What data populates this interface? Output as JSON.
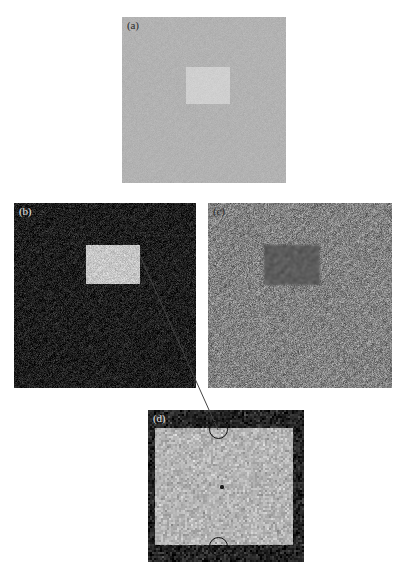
{
  "figure": {
    "width": 406,
    "height": 577,
    "background": "#ffffff"
  },
  "panels": [
    {
      "id": "a",
      "label": "(a)",
      "label_color": "#2a2a2a",
      "x": 122,
      "y": 17,
      "width": 164,
      "height": 166,
      "background_color": "#b2b2b2",
      "noise_level": "low",
      "inner_region": {
        "x": 64,
        "y": 50,
        "width": 44,
        "height": 37,
        "color": "#cfcfcf",
        "contrast": "brighter"
      }
    },
    {
      "id": "b",
      "label": "(b)",
      "label_color": "#e8e8e8",
      "x": 14,
      "y": 203,
      "width": 182,
      "height": 185,
      "background_color": "#1e1e1e",
      "noise_level": "high",
      "inner_region": {
        "x": 72,
        "y": 42,
        "width": 54,
        "height": 39,
        "color": "#c6c6c6",
        "contrast": "brighter"
      }
    },
    {
      "id": "c",
      "label": "(c)",
      "label_color": "#3a3a3a",
      "x": 208,
      "y": 203,
      "width": 184,
      "height": 185,
      "background_color": "#828282",
      "noise_level": "high",
      "inner_region": {
        "x": 56,
        "y": 42,
        "width": 56,
        "height": 40,
        "color": "#5c5c5c",
        "contrast": "darker"
      }
    },
    {
      "id": "d",
      "label": "(d)",
      "label_color": "#e8e8e8",
      "x": 148,
      "y": 410,
      "width": 156,
      "height": 152,
      "background_color": "#232323",
      "noise_level": "high",
      "inner_region": {
        "x": 7,
        "y": 18,
        "width": 138,
        "height": 117,
        "color": "#b4b4b4",
        "contrast": "brighter"
      }
    }
  ],
  "annotations": {
    "leader_line": {
      "name": "zoom-leader-line",
      "from_x": 140,
      "from_y": 256,
      "to_x": 218,
      "to_y": 430,
      "color": "#444444",
      "width": 1
    },
    "markers": [
      {
        "name": "boundary-marker-top",
        "cx": 218,
        "cy": 429,
        "r": 9.5,
        "color": "#111111"
      },
      {
        "name": "boundary-marker-bottom",
        "cx": 218,
        "cy": 546,
        "r": 9.5,
        "color": "#111111"
      }
    ],
    "center_speck": {
      "name": "center-speck",
      "cx": 222,
      "cy": 487,
      "r": 1.6
    }
  }
}
